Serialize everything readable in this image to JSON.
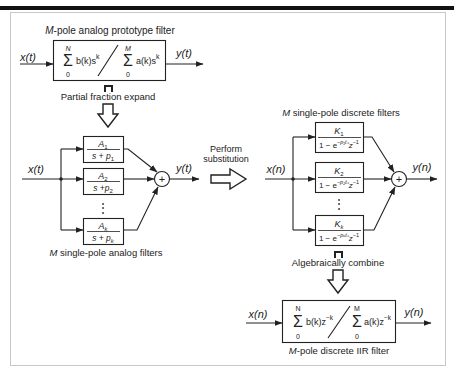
{
  "diagram": {
    "colors": {
      "ink": "#222222",
      "frame": "#c8c8c8",
      "top_bar": "#111111",
      "background": "#ffffff"
    },
    "prototype": {
      "title_var": "M",
      "title_rest": "-pole analog prototype filter",
      "input": "x(t)",
      "output": "y(t)",
      "num_sum_upper": "N",
      "num_sum_lower": "0",
      "num_term": "b(k)s",
      "num_exp": "k",
      "den_sum_upper": "M",
      "den_sum_lower": "0",
      "den_term": "a(k)s",
      "den_exp": "k"
    },
    "step1": {
      "label": "Partial fraction expand"
    },
    "analog_bank": {
      "input": "x(t)",
      "output": "y(t)",
      "sum_symbol": "+",
      "caption_var": "M",
      "caption_rest": " single-pole analog filters",
      "filters": [
        {
          "num": "A",
          "num_sub": "1",
          "den": "s + p",
          "den_sub": "1"
        },
        {
          "num": "A",
          "num_sub": "2",
          "den": "s +p",
          "den_sub": "2"
        },
        {
          "num": "A",
          "num_sub": "k",
          "den": "s + p",
          "den_sub": "k"
        }
      ],
      "ellipsis": "⋮"
    },
    "step2": {
      "line1": "Perform",
      "line2": "substitution"
    },
    "discrete_bank": {
      "title_var": "M",
      "title_rest": " single-pole discrete filters",
      "input": "x(n)",
      "output": "y(n)",
      "sum_symbol": "+",
      "filters": [
        {
          "num": "K",
          "num_sub": "1",
          "den_pre": "1 − e",
          "den_exp": "−p₁tₛ",
          "den_z": "z",
          "den_z_exp": "−1"
        },
        {
          "num": "K",
          "num_sub": "2",
          "den_pre": "1 − e",
          "den_exp": "−p₂tₛ",
          "den_z": "z",
          "den_z_exp": "−1"
        },
        {
          "num": "K",
          "num_sub": "k",
          "den_pre": "1 − e",
          "den_exp": "−pₖtₛ",
          "den_z": "z",
          "den_z_exp": "−1"
        }
      ],
      "ellipsis": "⋮"
    },
    "step3": {
      "label": "Algebraically combine"
    },
    "iir": {
      "input": "x(n)",
      "output": "y(n)",
      "num_sum_upper": "N",
      "num_sum_lower": "0",
      "num_term": "b(k)z",
      "num_exp": "−k",
      "den_sum_upper": "M",
      "den_sum_lower": "0",
      "den_term": "a(k)z",
      "den_exp": "−k",
      "caption_var": "M",
      "caption_rest": "-pole discrete IIR filter"
    }
  }
}
